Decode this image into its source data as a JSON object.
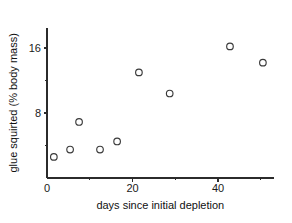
{
  "chart_data": {
    "type": "scatter",
    "title": "",
    "xlabel": "days since initial depletion",
    "ylabel": "glue squirted (% body mass)",
    "xlim": [
      0,
      53
    ],
    "ylim": [
      0,
      18.5
    ],
    "grid": false,
    "legend": null,
    "marker_style": "open-circle",
    "x_ticks_major": [
      0,
      20,
      40
    ],
    "x_ticks_major_labels": [
      "0",
      "20",
      "40"
    ],
    "x_ticks_minor": [
      10,
      30,
      50
    ],
    "y_ticks_major": [
      8,
      16
    ],
    "y_ticks_major_labels": [
      "8",
      "16"
    ],
    "y_ticks_minor": [
      4,
      12
    ],
    "points": [
      {
        "x": 1.6,
        "y": 2.6
      },
      {
        "x": 5.4,
        "y": 3.5
      },
      {
        "x": 7.5,
        "y": 6.9
      },
      {
        "x": 12.4,
        "y": 3.5
      },
      {
        "x": 16.4,
        "y": 4.5
      },
      {
        "x": 21.5,
        "y": 13.0
      },
      {
        "x": 28.7,
        "y": 10.4
      },
      {
        "x": 42.8,
        "y": 16.2
      },
      {
        "x": 50.5,
        "y": 14.2
      }
    ],
    "colors": {
      "axis": "#2b2b2b",
      "marker_stroke": "#3a3a3a",
      "background": "#ffffff",
      "text": "#1a1a1a"
    }
  }
}
